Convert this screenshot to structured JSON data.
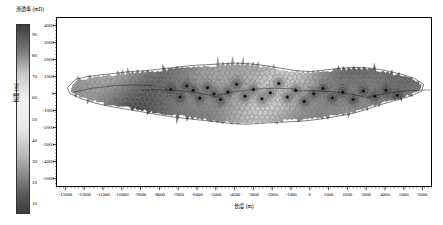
{
  "colorbar": {
    "title": "渗透率 (mD)",
    "unit": "mD",
    "ticks": [
      "90",
      "80",
      "70",
      "60",
      "50",
      "40",
      "30",
      "20",
      "10"
    ],
    "values": [
      90,
      80,
      70,
      60,
      50,
      40,
      30,
      20,
      10
    ],
    "min": 5,
    "max": 95,
    "gradient_top_color": "#3d3d3d",
    "gradient_mid_color": "#f2f2f2",
    "gradient_bottom_color": "#3d3d3d"
  },
  "axes": {
    "x_title": "长度 (m)",
    "y_title": "长度 (m)",
    "x_ticks": [
      "-13000",
      "-12000",
      "-11000",
      "-10000",
      "-9000",
      "-8000",
      "-7000",
      "-6000",
      "-5000",
      "-4000",
      "-3000",
      "-2000",
      "-1000",
      "0",
      "1000",
      "2000",
      "3000",
      "4000",
      "5000",
      "6000"
    ],
    "x_values": [
      -13000,
      -12000,
      -11000,
      -10000,
      -9000,
      -8000,
      -7000,
      -6000,
      -5000,
      -4000,
      -3000,
      -2000,
      -1000,
      0,
      1000,
      2000,
      3000,
      4000,
      5000,
      6000
    ],
    "y_ticks": [
      "4000",
      "3000",
      "2000",
      "1000",
      "0",
      "-1000",
      "-2000",
      "-3000",
      "-4000",
      "-5000"
    ],
    "y_values": [
      4000,
      3000,
      2000,
      1000,
      0,
      -1000,
      -2000,
      -3000,
      -4000,
      -5000
    ],
    "x_min": -13500,
    "x_max": 6500,
    "y_min": -5500,
    "y_max": 4500
  },
  "chart_data": {
    "type": "heatmap",
    "title": "渗透率 (mD)",
    "xlabel": "长度 (m)",
    "ylabel": "长度 (m)",
    "xlim": [
      -13500,
      6500
    ],
    "ylim": [
      -5500,
      4500
    ],
    "colorbar_label": "渗透率 (mD)",
    "colorbar_ticks": [
      90,
      80,
      70,
      60,
      50,
      40,
      30,
      20,
      10
    ],
    "grid": false,
    "legend": "colorbar-left",
    "wells": [
      {
        "x": -7450,
        "y": 300
      },
      {
        "x": -6950,
        "y": -150
      },
      {
        "x": -6600,
        "y": 500
      },
      {
        "x": -6250,
        "y": 250
      },
      {
        "x": -5900,
        "y": -200
      },
      {
        "x": -5500,
        "y": 400
      },
      {
        "x": -5150,
        "y": 50
      },
      {
        "x": -4800,
        "y": -300
      },
      {
        "x": -4400,
        "y": 150
      },
      {
        "x": -3950,
        "y": 600
      },
      {
        "x": -3500,
        "y": -100
      },
      {
        "x": -3050,
        "y": 300
      },
      {
        "x": -2600,
        "y": -250
      },
      {
        "x": -2150,
        "y": 100
      },
      {
        "x": -1700,
        "y": 650
      },
      {
        "x": -1250,
        "y": -150
      },
      {
        "x": -800,
        "y": 250
      },
      {
        "x": -350,
        "y": -400
      },
      {
        "x": 150,
        "y": 50
      },
      {
        "x": 650,
        "y": 350
      },
      {
        "x": 1150,
        "y": -200
      },
      {
        "x": 1700,
        "y": 150
      },
      {
        "x": 2250,
        "y": -300
      },
      {
        "x": 2800,
        "y": 200
      },
      {
        "x": 3400,
        "y": -100
      },
      {
        "x": 4000,
        "y": 250
      },
      {
        "x": 4600,
        "y": -50
      }
    ],
    "body_outline": [
      {
        "x": -12950,
        "y": 400
      },
      {
        "x": -12500,
        "y": 900
      },
      {
        "x": -11900,
        "y": 1050
      },
      {
        "x": -11200,
        "y": 1150
      },
      {
        "x": -10400,
        "y": 1250
      },
      {
        "x": -9600,
        "y": 1350
      },
      {
        "x": -8800,
        "y": 1400
      },
      {
        "x": -8000,
        "y": 1500
      },
      {
        "x": -7200,
        "y": 1600
      },
      {
        "x": -6400,
        "y": 1700
      },
      {
        "x": -5600,
        "y": 1750
      },
      {
        "x": -4800,
        "y": 1800
      },
      {
        "x": -4000,
        "y": 1850
      },
      {
        "x": -3200,
        "y": 1800
      },
      {
        "x": -2400,
        "y": 1700
      },
      {
        "x": -1600,
        "y": 1550
      },
      {
        "x": -800,
        "y": 1400
      },
      {
        "x": 0,
        "y": 1350
      },
      {
        "x": 800,
        "y": 1450
      },
      {
        "x": 1600,
        "y": 1550
      },
      {
        "x": 2400,
        "y": 1600
      },
      {
        "x": 3200,
        "y": 1550
      },
      {
        "x": 4000,
        "y": 1400
      },
      {
        "x": 4800,
        "y": 1200
      },
      {
        "x": 5500,
        "y": 950
      },
      {
        "x": 6000,
        "y": 600
      },
      {
        "x": 5900,
        "y": 200
      },
      {
        "x": 5300,
        "y": -100
      },
      {
        "x": 4500,
        "y": -350
      },
      {
        "x": 3700,
        "y": -600
      },
      {
        "x": 2900,
        "y": -900
      },
      {
        "x": 2100,
        "y": -1150
      },
      {
        "x": 1300,
        "y": -1300
      },
      {
        "x": 500,
        "y": -1450
      },
      {
        "x": -300,
        "y": -1550
      },
      {
        "x": -1100,
        "y": -1600
      },
      {
        "x": -1900,
        "y": -1650
      },
      {
        "x": -2700,
        "y": -1700
      },
      {
        "x": -3500,
        "y": -1750
      },
      {
        "x": -4300,
        "y": -1700
      },
      {
        "x": -5100,
        "y": -1600
      },
      {
        "x": -5900,
        "y": -1500
      },
      {
        "x": -6700,
        "y": -1400
      },
      {
        "x": -7500,
        "y": -1300
      },
      {
        "x": -8300,
        "y": -1150
      },
      {
        "x": -9100,
        "y": -1000
      },
      {
        "x": -9900,
        "y": -850
      },
      {
        "x": -10700,
        "y": -700
      },
      {
        "x": -11500,
        "y": -500
      },
      {
        "x": -12200,
        "y": -250
      },
      {
        "x": -12800,
        "y": 50
      }
    ]
  }
}
